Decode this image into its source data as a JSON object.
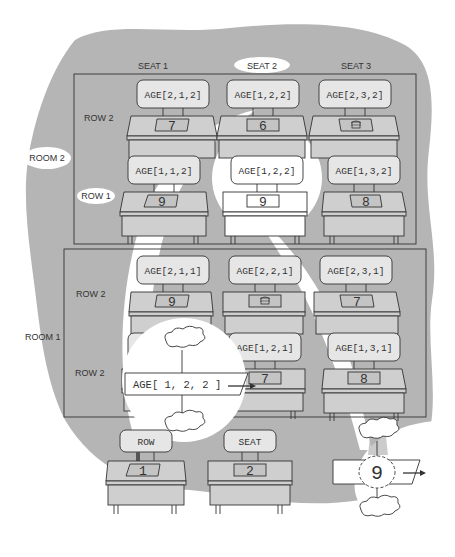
{
  "diagram": {
    "colors": {
      "background_blob": "#b5b5b5",
      "highlight": "#ffffff",
      "line": "#333333"
    },
    "seat_headers": [
      "SEAT 1",
      "SEAT 2",
      "SEAT 3"
    ],
    "highlighted_seat_header": "SEAT 2",
    "rooms": [
      {
        "label": "ROOM 2",
        "highlighted": true,
        "rows": [
          {
            "label": "ROW 2",
            "seats": [
              {
                "tag": "AGE[2,1,2]",
                "value": "7"
              },
              {
                "tag": "AGE[2,2,2]",
                "value": "6"
              },
              {
                "tag": "AGE[2,3,2]",
                "value": "basket-icon"
              }
            ]
          },
          {
            "label": "ROW 1",
            "highlighted": true,
            "seats": [
              {
                "tag": "AGE[1,1,2]",
                "value": "9"
              },
              {
                "tag": "AGE[1,2,2]",
                "value": "9",
                "highlighted": true
              },
              {
                "tag": "AGE[1,3,2]",
                "value": "8"
              }
            ]
          }
        ]
      },
      {
        "label": "ROOM 1",
        "rows": [
          {
            "label": "ROW 2",
            "seats": [
              {
                "tag": "AGE[2,1,1]",
                "value": "9"
              },
              {
                "tag": "AGE[2,2,1]",
                "value": "basket-icon"
              },
              {
                "tag": "AGE[2,3,1]",
                "value": "7"
              }
            ]
          },
          {
            "label": "ROW 1",
            "seats": [
              {
                "tag": "AGE[1,1,1]",
                "value": ""
              },
              {
                "tag": "AGE[1,2,1]",
                "value": "7"
              },
              {
                "tag": "AGE[1,3,1]",
                "value": "8"
              }
            ]
          }
        ]
      }
    ],
    "index_variables": [
      {
        "tag": "ROW",
        "value": "1"
      },
      {
        "tag": "SEAT",
        "value": "2"
      }
    ],
    "callout_statement": "AGE[ 1, 2, 2 ]",
    "callout_result": "9"
  }
}
